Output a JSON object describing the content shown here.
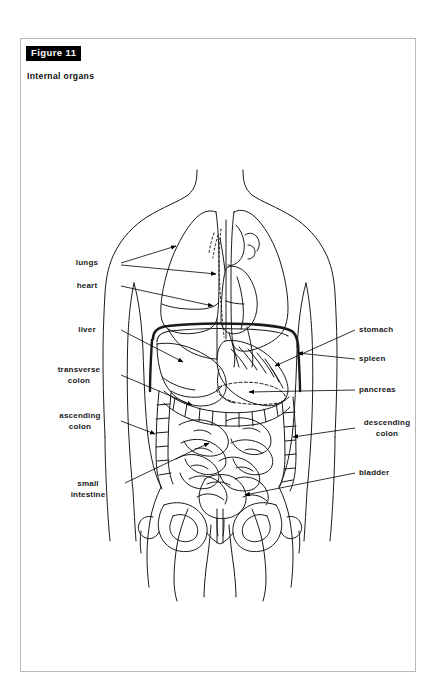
{
  "figure": {
    "badge": "Figure 11",
    "title": "Internal organs",
    "page_border_color": "#b9b9b9",
    "badge_bg_color": "#000000",
    "badge_text_color": "#ffffff",
    "line_color": "#000000",
    "label_color": "#1a1a1a",
    "leader_color": "#6b6b6b"
  },
  "labels": {
    "left": [
      {
        "id": "lungs",
        "text": "lungs",
        "lines": [
          "lungs"
        ],
        "x": 96,
        "y": 224,
        "align": "right"
      },
      {
        "id": "heart",
        "text": "heart",
        "lines": [
          "heart"
        ],
        "x": 96,
        "y": 247,
        "align": "right"
      },
      {
        "id": "liver",
        "text": "liver",
        "lines": [
          "liver"
        ],
        "x": 96,
        "y": 291,
        "align": "right"
      },
      {
        "id": "transverse-colon",
        "text": "transverse colon",
        "lines": [
          "transverse",
          "colon"
        ],
        "x": 96,
        "y": 336,
        "align": "right"
      },
      {
        "id": "ascending-colon",
        "text": "ascending colon",
        "lines": [
          "ascending",
          "colon"
        ],
        "x": 96,
        "y": 382,
        "align": "right"
      },
      {
        "id": "small-intestine",
        "text": "small intestine",
        "lines": [
          "small",
          "intestine"
        ],
        "x": 100,
        "y": 450,
        "align": "right"
      }
    ],
    "right": [
      {
        "id": "stomach",
        "text": "stomach",
        "lines": [
          "stomach"
        ],
        "x": 338,
        "y": 291,
        "align": "left"
      },
      {
        "id": "spleen",
        "text": "spleen",
        "lines": [
          "spleen"
        ],
        "x": 338,
        "y": 320,
        "align": "left"
      },
      {
        "id": "pancreas",
        "text": "pancreas",
        "lines": [
          "pancreas"
        ],
        "x": 338,
        "y": 351,
        "align": "left"
      },
      {
        "id": "descending-colon",
        "text": "descending colon",
        "lines": [
          "descending",
          "colon"
        ],
        "x": 338,
        "y": 389,
        "align": "left"
      },
      {
        "id": "bladder",
        "text": "bladder",
        "lines": [
          "bladder"
        ],
        "x": 338,
        "y": 434,
        "align": "left"
      }
    ]
  },
  "organs_depicted": [
    "lungs",
    "heart",
    "liver",
    "stomach",
    "spleen",
    "pancreas",
    "transverse colon",
    "ascending colon",
    "descending colon",
    "small intestine",
    "bladder",
    "diaphragm",
    "pelvis"
  ]
}
